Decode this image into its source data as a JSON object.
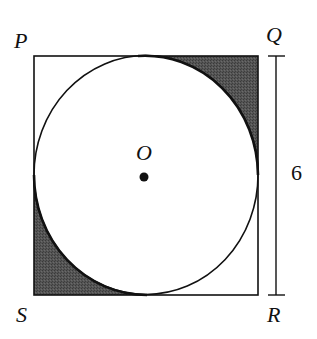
{
  "figure": {
    "type": "geometry-diagram",
    "vertices": {
      "P": "P",
      "Q": "Q",
      "R": "R",
      "S": "S"
    },
    "center_label": "O",
    "side_length_label": "6",
    "shaded_regions": [
      "corner-Q",
      "corner-S"
    ],
    "colors": {
      "stroke": "#111111",
      "shade": "#4a4a4a",
      "background": "#ffffff"
    }
  }
}
